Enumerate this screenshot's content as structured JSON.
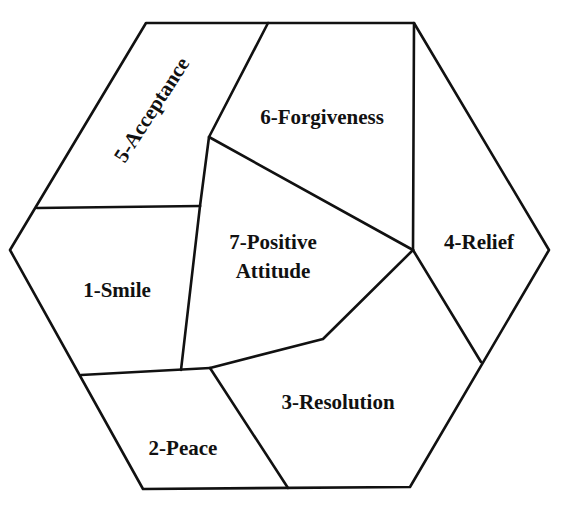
{
  "diagram": {
    "shape": "hexagon",
    "line_color": "#111111",
    "background": "#ffffff",
    "regions": [
      {
        "id": 1,
        "label": "1-Smile"
      },
      {
        "id": 2,
        "label": "2-Peace"
      },
      {
        "id": 3,
        "label": "3-Resolution"
      },
      {
        "id": 4,
        "label": "4-Relief"
      },
      {
        "id": 5,
        "label": "5-Acceptance"
      },
      {
        "id": 6,
        "label": "6-Forgiveness"
      },
      {
        "id": 7,
        "label_line1": "7-Positive",
        "label_line2": "Attitude"
      }
    ]
  }
}
